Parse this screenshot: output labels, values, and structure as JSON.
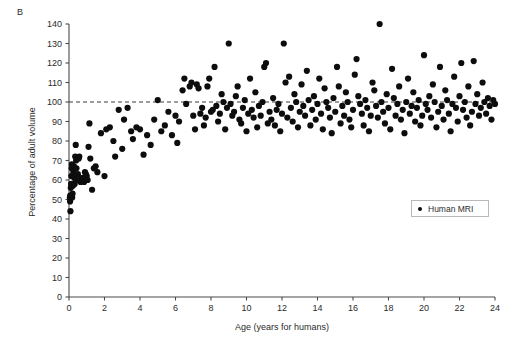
{
  "figure": {
    "panel_label": "B"
  },
  "legend": {
    "position": "inside-right",
    "entries": [
      {
        "label": "Human MRI",
        "marker": "filled-circle",
        "color": "#0d0d0d"
      }
    ]
  },
  "annotations": {
    "reference_line": {
      "y": 100,
      "style": "dashed",
      "color": "#3a3a3a",
      "label": ""
    }
  },
  "chart_data": {
    "type": "scatter",
    "title": "",
    "subtitle": "",
    "xlabel": "Age (years for humans)",
    "ylabel": "Percentage of adult volume",
    "xlim": [
      0,
      24
    ],
    "ylim": [
      0,
      140
    ],
    "xticks": [
      0,
      2,
      4,
      6,
      8,
      10,
      12,
      14,
      16,
      18,
      20,
      22,
      24
    ],
    "yticks": [
      0,
      10,
      20,
      30,
      40,
      50,
      60,
      70,
      80,
      90,
      100,
      110,
      120,
      130,
      140
    ],
    "xtick_labels": [
      "0",
      "2",
      "4",
      "6",
      "8",
      "10",
      "12",
      "14",
      "16",
      "18",
      "20",
      "22",
      "24"
    ],
    "ytick_labels": [
      "0",
      "10",
      "20",
      "30",
      "40",
      "50",
      "60",
      "70",
      "80",
      "90",
      "100",
      "110",
      "120",
      "130",
      "140"
    ],
    "grid": false,
    "legend_position": "inside-right",
    "marker": {
      "shape": "circle",
      "size": 3.1,
      "color": "#0d0d0d"
    },
    "series": [
      {
        "name": "Human MRI",
        "color": "#0d0d0d",
        "points": [
          [
            0.05,
            51
          ],
          [
            0.06,
            49
          ],
          [
            0.07,
            52
          ],
          [
            0.08,
            44
          ],
          [
            0.1,
            56
          ],
          [
            0.12,
            58
          ],
          [
            0.13,
            62
          ],
          [
            0.15,
            66
          ],
          [
            0.16,
            68
          ],
          [
            0.18,
            51
          ],
          [
            0.2,
            53
          ],
          [
            0.22,
            57
          ],
          [
            0.25,
            64
          ],
          [
            0.28,
            67
          ],
          [
            0.3,
            61
          ],
          [
            0.32,
            58
          ],
          [
            0.35,
            72
          ],
          [
            0.38,
            78
          ],
          [
            0.4,
            70
          ],
          [
            0.42,
            66
          ],
          [
            0.45,
            60
          ],
          [
            0.5,
            63
          ],
          [
            0.55,
            71
          ],
          [
            0.58,
            72
          ],
          [
            0.62,
            60
          ],
          [
            0.65,
            59
          ],
          [
            0.7,
            61
          ],
          [
            0.75,
            60
          ],
          [
            0.78,
            60
          ],
          [
            0.8,
            61
          ],
          [
            0.85,
            59
          ],
          [
            0.9,
            64
          ],
          [
            0.95,
            63
          ],
          [
            1.0,
            62
          ],
          [
            1.05,
            60
          ],
          [
            1.1,
            77
          ],
          [
            1.15,
            89
          ],
          [
            1.2,
            71
          ],
          [
            1.3,
            55
          ],
          [
            1.4,
            66
          ],
          [
            1.5,
            67
          ],
          [
            1.6,
            64
          ],
          [
            1.8,
            84
          ],
          [
            2.0,
            62
          ],
          [
            2.1,
            86
          ],
          [
            2.3,
            87
          ],
          [
            2.5,
            80
          ],
          [
            2.6,
            72
          ],
          [
            2.8,
            96
          ],
          [
            3.0,
            76
          ],
          [
            3.1,
            91
          ],
          [
            3.3,
            97
          ],
          [
            3.5,
            85
          ],
          [
            3.6,
            81
          ],
          [
            3.8,
            87
          ],
          [
            4.0,
            86
          ],
          [
            4.2,
            73
          ],
          [
            4.4,
            83
          ],
          [
            4.6,
            78
          ],
          [
            4.8,
            91
          ],
          [
            5.0,
            101
          ],
          [
            5.2,
            85
          ],
          [
            5.4,
            88
          ],
          [
            5.6,
            95
          ],
          [
            5.8,
            83
          ],
          [
            6.0,
            93
          ],
          [
            6.1,
            79
          ],
          [
            6.2,
            90
          ],
          [
            6.4,
            106
          ],
          [
            6.5,
            112
          ],
          [
            6.6,
            99
          ],
          [
            6.8,
            108
          ],
          [
            6.9,
            110
          ],
          [
            7.0,
            93
          ],
          [
            7.1,
            86
          ],
          [
            7.2,
            109
          ],
          [
            7.3,
            107
          ],
          [
            7.4,
            94
          ],
          [
            7.5,
            97
          ],
          [
            7.6,
            88
          ],
          [
            7.7,
            92
          ],
          [
            7.8,
            108
          ],
          [
            7.9,
            112
          ],
          [
            8.0,
            95
          ],
          [
            8.1,
            96
          ],
          [
            8.2,
            118
          ],
          [
            8.3,
            98
          ],
          [
            8.4,
            90
          ],
          [
            8.5,
            94
          ],
          [
            8.6,
            104
          ],
          [
            8.7,
            100
          ],
          [
            8.8,
            86
          ],
          [
            8.9,
            97
          ],
          [
            9.0,
            130
          ],
          [
            9.1,
            99
          ],
          [
            9.2,
            93
          ],
          [
            9.3,
            95
          ],
          [
            9.4,
            103
          ],
          [
            9.5,
            108
          ],
          [
            9.6,
            91
          ],
          [
            9.7,
            89
          ],
          [
            9.8,
            97
          ],
          [
            9.9,
            101
          ],
          [
            10.0,
            85
          ],
          [
            10.1,
            94
          ],
          [
            10.2,
            112
          ],
          [
            10.3,
            96
          ],
          [
            10.4,
            92
          ],
          [
            10.5,
            105
          ],
          [
            10.6,
            87
          ],
          [
            10.7,
            98
          ],
          [
            10.8,
            93
          ],
          [
            10.9,
            100
          ],
          [
            11.0,
            118
          ],
          [
            11.1,
            120
          ],
          [
            11.2,
            89
          ],
          [
            11.3,
            95
          ],
          [
            11.4,
            91
          ],
          [
            11.5,
            102
          ],
          [
            11.6,
            88
          ],
          [
            11.7,
            96
          ],
          [
            11.8,
            99
          ],
          [
            11.9,
            85
          ],
          [
            12.0,
            94
          ],
          [
            12.1,
            130
          ],
          [
            12.2,
            110
          ],
          [
            12.3,
            92
          ],
          [
            12.4,
            113
          ],
          [
            12.5,
            97
          ],
          [
            12.6,
            90
          ],
          [
            12.7,
            104
          ],
          [
            12.8,
            100
          ],
          [
            12.9,
            87
          ],
          [
            13.0,
            95
          ],
          [
            13.1,
            109
          ],
          [
            13.2,
            98
          ],
          [
            13.3,
            93
          ],
          [
            13.4,
            116
          ],
          [
            13.5,
            101
          ],
          [
            13.6,
            88
          ],
          [
            13.7,
            96
          ],
          [
            13.8,
            103
          ],
          [
            13.9,
            91
          ],
          [
            14.0,
            99
          ],
          [
            14.1,
            112
          ],
          [
            14.2,
            94
          ],
          [
            14.3,
            86
          ],
          [
            14.4,
            107
          ],
          [
            14.5,
            100
          ],
          [
            14.6,
            97
          ],
          [
            14.7,
            92
          ],
          [
            14.8,
            84
          ],
          [
            14.9,
            102
          ],
          [
            15.0,
            95
          ],
          [
            15.1,
            118
          ],
          [
            15.2,
            108
          ],
          [
            15.3,
            89
          ],
          [
            15.4,
            98
          ],
          [
            15.5,
            93
          ],
          [
            15.6,
            105
          ],
          [
            15.7,
            100
          ],
          [
            15.8,
            91
          ],
          [
            15.9,
            87
          ],
          [
            16.0,
            96
          ],
          [
            16.1,
            114
          ],
          [
            16.2,
            122
          ],
          [
            16.3,
            103
          ],
          [
            16.4,
            99
          ],
          [
            16.5,
            94
          ],
          [
            16.6,
            88
          ],
          [
            16.7,
            101
          ],
          [
            16.8,
            97
          ],
          [
            16.9,
            85
          ],
          [
            17.0,
            93
          ],
          [
            17.1,
            110
          ],
          [
            17.2,
            106
          ],
          [
            17.3,
            98
          ],
          [
            17.4,
            92
          ],
          [
            17.5,
            140
          ],
          [
            17.6,
            100
          ],
          [
            17.7,
            95
          ],
          [
            17.8,
            89
          ],
          [
            17.9,
            104
          ],
          [
            18.0,
            97
          ],
          [
            18.1,
            86
          ],
          [
            18.2,
            117
          ],
          [
            18.3,
            102
          ],
          [
            18.4,
            93
          ],
          [
            18.5,
            99
          ],
          [
            18.6,
            108
          ],
          [
            18.7,
            91
          ],
          [
            18.8,
            96
          ],
          [
            18.9,
            84
          ],
          [
            19.0,
            100
          ],
          [
            19.1,
            112
          ],
          [
            19.2,
            94
          ],
          [
            19.3,
            98
          ],
          [
            19.4,
            105
          ],
          [
            19.5,
            90
          ],
          [
            19.6,
            97
          ],
          [
            19.7,
            101
          ],
          [
            19.8,
            88
          ],
          [
            19.9,
            93
          ],
          [
            20.0,
            124
          ],
          [
            20.1,
            99
          ],
          [
            20.2,
            96
          ],
          [
            20.3,
            103
          ],
          [
            20.4,
            92
          ],
          [
            20.5,
            109
          ],
          [
            20.6,
            100
          ],
          [
            20.7,
            87
          ],
          [
            20.8,
            95
          ],
          [
            20.9,
            118
          ],
          [
            21.0,
            98
          ],
          [
            21.1,
            91
          ],
          [
            21.2,
            106
          ],
          [
            21.3,
            101
          ],
          [
            21.4,
            94
          ],
          [
            21.5,
            85
          ],
          [
            21.6,
            99
          ],
          [
            21.7,
            113
          ],
          [
            21.8,
            97
          ],
          [
            21.9,
            90
          ],
          [
            22.0,
            103
          ],
          [
            22.1,
            120
          ],
          [
            22.2,
            96
          ],
          [
            22.3,
            100
          ],
          [
            22.4,
            92
          ],
          [
            22.5,
            108
          ],
          [
            22.6,
            88
          ],
          [
            22.7,
            95
          ],
          [
            22.8,
            121
          ],
          [
            22.9,
            99
          ],
          [
            23.0,
            104
          ],
          [
            23.1,
            93
          ],
          [
            23.2,
            97
          ],
          [
            23.3,
            110
          ],
          [
            23.4,
            100
          ],
          [
            23.5,
            94
          ],
          [
            23.6,
            102
          ],
          [
            23.7,
            98
          ],
          [
            23.8,
            91
          ],
          [
            23.9,
            101
          ],
          [
            24.0,
            99
          ]
        ]
      }
    ]
  }
}
